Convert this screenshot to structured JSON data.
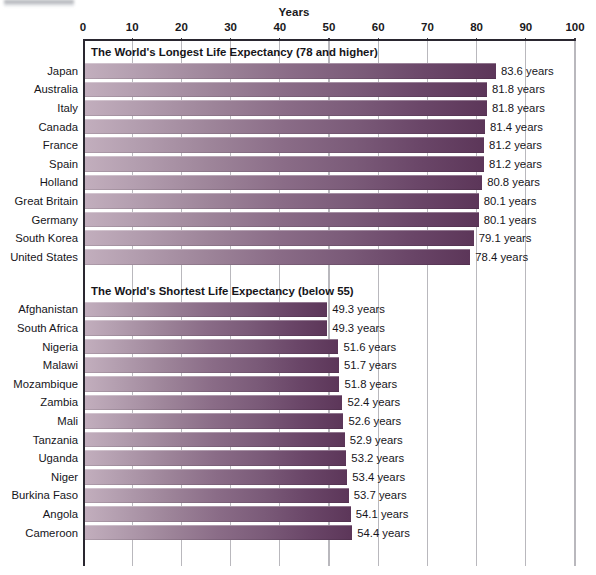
{
  "chart_data": {
    "type": "bar",
    "orientation": "horizontal",
    "title": "",
    "xlabel": "Years",
    "ylabel": "",
    "xlim": [
      0,
      100
    ],
    "xticks": [
      0,
      10,
      20,
      30,
      40,
      50,
      60,
      70,
      80,
      90,
      100
    ],
    "grid": true,
    "legend": "none",
    "value_suffix": "years",
    "groups": [
      {
        "header": "The World's Longest Life Expectancy (78 and higher)",
        "categories": [
          "Japan",
          "Australia",
          "Italy",
          "Canada",
          "France",
          "Spain",
          "Holland",
          "Great Britain",
          "Germany",
          "South Korea",
          "United States"
        ],
        "values": [
          83.6,
          81.8,
          81.8,
          81.4,
          81.2,
          81.2,
          80.8,
          80.1,
          80.1,
          79.1,
          78.4
        ],
        "labels": [
          "83.6 years",
          "81.8 years",
          "81.8 years",
          "81.4 years",
          "81.2 years",
          "81.2 years",
          "80.8 years",
          "80.1 years",
          "80.1 years",
          "79.1 years",
          "78.4 years"
        ]
      },
      {
        "header": "The World's Shortest Life Expectancy (below 55)",
        "categories": [
          "Afghanistan",
          "South Africa",
          "Nigeria",
          "Malawi",
          "Mozambique",
          "Zambia",
          "Mali",
          "Tanzania",
          "Uganda",
          "Niger",
          "Burkina Faso",
          "Angola",
          "Cameroon"
        ],
        "values": [
          49.3,
          49.3,
          51.6,
          51.7,
          51.8,
          52.4,
          52.6,
          52.9,
          53.2,
          53.4,
          53.7,
          54.1,
          54.4
        ],
        "labels": [
          "49.3 years",
          "49.3 years",
          "51.6 years",
          "51.7 years",
          "51.8 years",
          "52.4 years",
          "52.6 years",
          "52.9 years",
          "53.2 years",
          "53.4 years",
          "53.7 years",
          "54.1 years",
          "54.4 years"
        ]
      }
    ],
    "colors": {
      "bar_gradient_start": "#c2aebd",
      "bar_gradient_end": "#5c3659",
      "axis": "#2a2730",
      "gridline": "#b9b8bd",
      "text": "#16151a",
      "background": "#ffffff"
    }
  }
}
